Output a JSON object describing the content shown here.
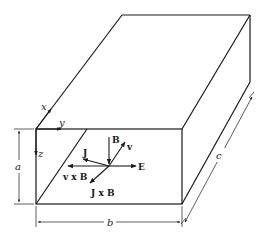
{
  "figure": {
    "axes": {
      "x": "x",
      "y": "y",
      "z": "z"
    },
    "dimensions": {
      "height": "a",
      "width": "b",
      "depth": "c"
    },
    "vectors": {
      "B": "B",
      "v": "v",
      "J": "J",
      "E": "E",
      "vxB": "v x B",
      "JxB": "J x B"
    }
  },
  "colors": {
    "line": "#1a1a1a",
    "background": "#ffffff"
  }
}
